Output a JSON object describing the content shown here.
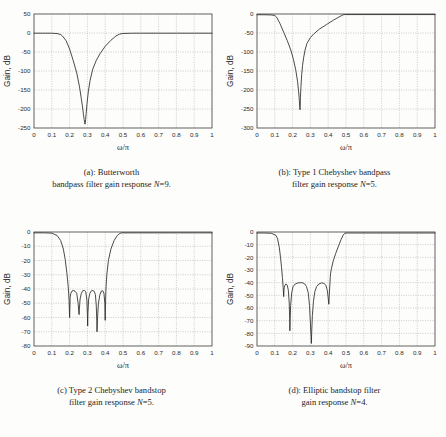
{
  "figure": {
    "panels": [
      {
        "id": "a",
        "caption_line1": "(a): Butterworth",
        "caption_line2_pre": "bandpass filter gain response ",
        "caption_line2_ital": "N",
        "caption_line2_post": "=9.",
        "xlabel": "ω/π",
        "ylabel": "Gain, dB"
      },
      {
        "id": "b",
        "caption_line1": "(b): Type 1 Chebyshev bandpass",
        "caption_line2_pre": "filter gain response ",
        "caption_line2_ital": "N",
        "caption_line2_post": "=5.",
        "xlabel": "ω/π",
        "ylabel": "Gain, dB"
      },
      {
        "id": "c",
        "caption_line1": "(c) Type 2 Chebyshev bandstop",
        "caption_line2_pre": "filter gain response ",
        "caption_line2_ital": "N",
        "caption_line2_post": "=5.",
        "xlabel": "ω/π",
        "ylabel": "Gain, dB"
      },
      {
        "id": "d",
        "caption_line1": "(d): Elliptic bandstop filter",
        "caption_line2_pre": "gain response ",
        "caption_line2_ital": "N",
        "caption_line2_post": "=4.",
        "xlabel": "ω/π",
        "ylabel": "Gain, dB"
      }
    ]
  },
  "chart_data": [
    {
      "type": "line",
      "panel": "a",
      "title": "(a): Butterworth bandpass filter gain response N=9.",
      "xlabel": "ω/π",
      "ylabel": "Gain, dB",
      "xlim": [
        0,
        1
      ],
      "ylim": [
        -250,
        50
      ],
      "xticks": [
        0,
        0.1,
        0.2,
        0.3,
        0.4,
        0.5,
        0.6,
        0.7,
        0.8,
        0.9,
        1
      ],
      "xticklabels": [
        "0",
        "0.1",
        "0.2",
        "0.3",
        "0.4",
        "0.5",
        "0.6",
        "0.7",
        "0.8",
        "0.9",
        "1"
      ],
      "yticks": [
        50,
        0,
        -50,
        -100,
        -150,
        -200,
        -250
      ],
      "yticklabels": [
        "50",
        "0",
        "-50",
        "-100",
        "-150",
        "-200",
        "-250"
      ],
      "grid": true,
      "legend": null,
      "series": [
        {
          "name": "Butterworth bandpass N=9",
          "x": [
            0,
            0.05,
            0.1,
            0.13,
            0.15,
            0.16,
            0.18,
            0.2,
            0.22,
            0.24,
            0.255,
            0.265,
            0.272,
            0.278,
            0.282,
            0.285,
            0.2865,
            0.288,
            0.29,
            0.293,
            0.298,
            0.305,
            0.315,
            0.33,
            0.35,
            0.37,
            0.4,
            0.43,
            0.46,
            0.48,
            0.5,
            0.55,
            0.6,
            0.7,
            0.8,
            0.9,
            1.0
          ],
          "y": [
            -0.5,
            -0.5,
            -0.6,
            -1.5,
            -4,
            -8,
            -20,
            -42,
            -72,
            -105,
            -140,
            -170,
            -192,
            -215,
            -228,
            -236,
            -240,
            -236,
            -228,
            -212,
            -185,
            -155,
            -125,
            -95,
            -72,
            -55,
            -35,
            -20,
            -8,
            -3,
            -1.2,
            -0.6,
            -0.5,
            -0.5,
            -0.5,
            -0.5,
            -0.5
          ]
        }
      ]
    },
    {
      "type": "line",
      "panel": "b",
      "title": "(b): Type 1 Chebyshev bandpass filter gain response N=5.",
      "xlabel": "ω/π",
      "ylabel": "Gain, dB",
      "xlim": [
        0,
        1
      ],
      "ylim": [
        -300,
        0
      ],
      "xticks": [
        0,
        0.1,
        0.2,
        0.3,
        0.4,
        0.5,
        0.6,
        0.7,
        0.8,
        0.9,
        1
      ],
      "xticklabels": [
        "0",
        "0.1",
        "0.2",
        "0.3",
        "0.4",
        "0.5",
        "0.6",
        "0.7",
        "0.8",
        "0.9",
        "1"
      ],
      "yticks": [
        0,
        -50,
        -100,
        -150,
        -200,
        -250,
        -300
      ],
      "yticklabels": [
        "0",
        "-50",
        "-100",
        "-150",
        "-200",
        "-250",
        "-300"
      ],
      "grid": true,
      "legend": null,
      "series": [
        {
          "name": "Type 1 Chebyshev bandpass N=5",
          "x": [
            0,
            0.04,
            0.08,
            0.1,
            0.11,
            0.13,
            0.15,
            0.17,
            0.19,
            0.205,
            0.218,
            0.228,
            0.234,
            0.238,
            0.2405,
            0.2415,
            0.2425,
            0.244,
            0.247,
            0.251,
            0.256,
            0.262,
            0.27,
            0.28,
            0.3,
            0.32,
            0.35,
            0.39,
            0.43,
            0.46,
            0.48,
            0.49,
            0.5,
            0.55,
            0.6,
            0.7,
            0.8,
            0.9,
            1.0
          ],
          "y": [
            -2,
            -2,
            -2.5,
            -4,
            -8,
            -26,
            -48,
            -70,
            -95,
            -120,
            -148,
            -178,
            -205,
            -228,
            -245,
            -252,
            -243,
            -220,
            -190,
            -160,
            -135,
            -115,
            -95,
            -78,
            -62,
            -52,
            -40,
            -28,
            -16,
            -8,
            -3,
            -1.5,
            -1.5,
            -1.5,
            -1.5,
            -1.5,
            -1.5,
            -1.5,
            -1.5
          ]
        }
      ]
    },
    {
      "type": "line",
      "panel": "c",
      "title": "(c) Type 2 Chebyshev bandstop filter gain response N=5.",
      "xlabel": "ω/π",
      "ylabel": "Gain, dB",
      "xlim": [
        0,
        1
      ],
      "ylim": [
        -80,
        0
      ],
      "xticks": [
        0,
        0.1,
        0.2,
        0.3,
        0.4,
        0.5,
        0.6,
        0.7,
        0.8,
        0.9,
        1
      ],
      "xticklabels": [
        "0",
        "0.1",
        "0.2",
        "0.3",
        "0.4",
        "0.5",
        "0.6",
        "0.7",
        "0.8",
        "0.9",
        "1"
      ],
      "yticks": [
        0,
        -10,
        -20,
        -30,
        -40,
        -50,
        -60,
        -70,
        -80
      ],
      "yticklabels": [
        "0",
        "-10",
        "-20",
        "-30",
        "-40",
        "-50",
        "-60",
        "-70",
        "-80"
      ],
      "grid": true,
      "legend": null,
      "stopband_ripple_db": -41,
      "series": [
        {
          "name": "Type 2 Chebyshev bandstop N=5",
          "x": [
            0,
            0.06,
            0.1,
            0.13,
            0.15,
            0.165,
            0.175,
            0.185,
            0.192,
            0.197,
            0.2,
            0.2015,
            0.203,
            0.207,
            0.213,
            0.221,
            0.23,
            0.24,
            0.248,
            0.252,
            0.2535,
            0.255,
            0.259,
            0.266,
            0.274,
            0.283,
            0.291,
            0.297,
            0.3,
            0.3015,
            0.303,
            0.307,
            0.314,
            0.322,
            0.33,
            0.338,
            0.345,
            0.35,
            0.3525,
            0.354,
            0.357,
            0.362,
            0.37,
            0.378,
            0.386,
            0.393,
            0.398,
            0.4,
            0.4015,
            0.404,
            0.409,
            0.418,
            0.432,
            0.45,
            0.468,
            0.482,
            0.492,
            0.5,
            0.55,
            0.6,
            0.7,
            0.8,
            0.9,
            1.0
          ],
          "y": [
            -0.6,
            -0.6,
            -0.8,
            -2.5,
            -6,
            -12,
            -19,
            -29,
            -38,
            -48,
            -60,
            -54,
            -46,
            -43,
            -41.5,
            -41,
            -41.5,
            -43,
            -50,
            -57,
            -58,
            -54,
            -47,
            -43,
            -41.2,
            -41,
            -42,
            -48,
            -58,
            -66,
            -57,
            -47,
            -43,
            -41.3,
            -41,
            -41.6,
            -44,
            -52,
            -62,
            -70,
            -60,
            -50,
            -44,
            -41.5,
            -41.2,
            -43,
            -50,
            -62,
            -52,
            -40,
            -30,
            -20,
            -12,
            -6,
            -2.5,
            -1,
            -0.6,
            -0.6,
            -0.6,
            -0.6,
            -0.6,
            -0.6,
            -0.6,
            -0.6
          ]
        }
      ]
    },
    {
      "type": "line",
      "panel": "d",
      "title": "(d): Elliptic bandstop filter gain response N=4.",
      "xlabel": "ω/π",
      "ylabel": "Gain, dB",
      "xlim": [
        0,
        1
      ],
      "ylim": [
        -90,
        0
      ],
      "xticks": [
        0,
        0.1,
        0.2,
        0.3,
        0.4,
        0.5,
        0.6,
        0.7,
        0.8,
        0.9,
        1
      ],
      "xticklabels": [
        "0",
        "0.1",
        "0.2",
        "0.3",
        "0.4",
        "0.5",
        "0.6",
        "0.7",
        "0.8",
        "0.9",
        "1"
      ],
      "yticks": [
        0,
        -10,
        -20,
        -30,
        -40,
        -50,
        -60,
        -70,
        -80,
        -90
      ],
      "yticklabels": [
        "0",
        "-10",
        "-20",
        "-30",
        "-40",
        "-50",
        "-60",
        "-70",
        "-80",
        "-90"
      ],
      "grid": true,
      "legend": null,
      "stopband_ripple_db": -40,
      "series": [
        {
          "name": "Elliptic bandstop N=4",
          "x": [
            0,
            0.04,
            0.08,
            0.105,
            0.115,
            0.125,
            0.132,
            0.138,
            0.143,
            0.147,
            0.15,
            0.1515,
            0.153,
            0.157,
            0.163,
            0.17,
            0.176,
            0.181,
            0.1835,
            0.1848,
            0.1862,
            0.189,
            0.195,
            0.203,
            0.215,
            0.23,
            0.245,
            0.258,
            0.268,
            0.278,
            0.288,
            0.295,
            0.3,
            0.3035,
            0.3055,
            0.307,
            0.311,
            0.317,
            0.325,
            0.335,
            0.348,
            0.362,
            0.375,
            0.387,
            0.395,
            0.4,
            0.4035,
            0.406,
            0.41,
            0.4115,
            0.413,
            0.418,
            0.428,
            0.442,
            0.458,
            0.472,
            0.484,
            0.493,
            0.5,
            0.55,
            0.6,
            0.7,
            0.8,
            0.9,
            1.0
          ],
          "y": [
            -0.8,
            -0.8,
            -1.0,
            -2.5,
            -5,
            -12,
            -20,
            -28,
            -36,
            -44,
            -51,
            -46,
            -44,
            -42,
            -41,
            -42,
            -46,
            -56,
            -68,
            -78,
            -70,
            -58,
            -48,
            -43,
            -41,
            -40.2,
            -40,
            -40.2,
            -41,
            -43,
            -48,
            -58,
            -72,
            -82,
            -88,
            -80,
            -66,
            -55,
            -47,
            -43,
            -41,
            -40.2,
            -40.5,
            -42,
            -46,
            -52,
            -57,
            -50,
            -40,
            -36,
            -33,
            -29,
            -23,
            -17,
            -11,
            -6,
            -2.5,
            -1,
            -0.8,
            -0.8,
            -0.8,
            -0.8,
            -0.8,
            -0.8,
            -0.8
          ]
        }
      ]
    }
  ]
}
